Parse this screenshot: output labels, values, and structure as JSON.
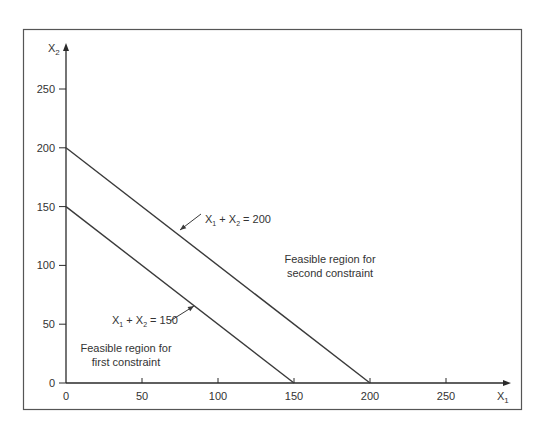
{
  "chart_data": {
    "type": "line",
    "title": "",
    "xlabel": "X1",
    "ylabel": "X2",
    "xlim": [
      0,
      260
    ],
    "ylim": [
      0,
      260
    ],
    "x_ticks": [
      0,
      50,
      100,
      150,
      200,
      250
    ],
    "y_ticks": [
      0,
      50,
      100,
      150,
      200,
      250
    ],
    "grid": false,
    "legend": null,
    "series": [
      {
        "name": "X1 + X2 = 150",
        "x": [
          0,
          150
        ],
        "y": [
          150,
          0
        ]
      },
      {
        "name": "X1 + X2 = 200",
        "x": [
          0,
          200
        ],
        "y": [
          200,
          0
        ]
      }
    ],
    "annotations": [
      {
        "text": "X1 + X2 = 200",
        "label_parts": [
          "X",
          "1",
          " + X",
          "2",
          " = 200"
        ],
        "points_to": [
          75,
          125
        ]
      },
      {
        "text": "X1 + X2 = 150",
        "label_parts": [
          "X",
          "1",
          " + X",
          "2",
          " = 150"
        ],
        "points_to": [
          83,
          67
        ]
      },
      {
        "text": "Feasible region for second constraint",
        "lines": [
          "Feasible region for",
          "second constraint"
        ]
      },
      {
        "text": "Feasible region for first constraint",
        "lines": [
          "Feasible region for",
          "first constraint"
        ]
      }
    ],
    "colors": {
      "line": "#3a3a3a",
      "axis": "#2a2a2a",
      "frame": "#555555",
      "text": "#333333"
    }
  },
  "axis_labels": {
    "x": "X",
    "x_sub": "1",
    "y": "X",
    "y_sub": "2"
  }
}
